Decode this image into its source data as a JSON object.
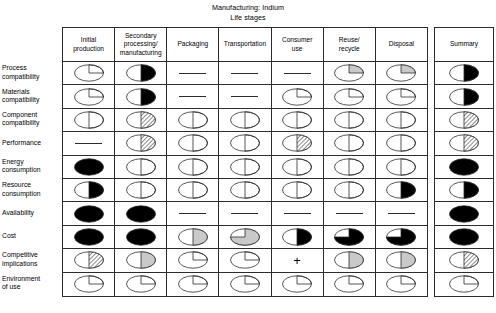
{
  "title": {
    "line1": "Manufacturing: Indium",
    "line2": "Life stages"
  },
  "columns": [
    {
      "id": "initial-production",
      "label": "Initial\nproduction"
    },
    {
      "id": "secondary-processing",
      "label": "Secondary\nprocessing/\nmanufacturing"
    },
    {
      "id": "packaging",
      "label": "Packaging"
    },
    {
      "id": "transportation",
      "label": "Transportation"
    },
    {
      "id": "consumer-use",
      "label": "Consumer\nuse"
    },
    {
      "id": "reuse-recycle",
      "label": "Reuse/\nrecycle"
    },
    {
      "id": "disposal",
      "label": "Disposal"
    }
  ],
  "summary_column": {
    "id": "summary",
    "label": "Summary"
  },
  "rows": [
    {
      "id": "process-compatibility",
      "label": "Process\ncompatibility"
    },
    {
      "id": "materials-compatibility",
      "label": "Materials\ncompatibility"
    },
    {
      "id": "component-compatibility",
      "label": "Component\ncompatibility"
    },
    {
      "id": "performance",
      "label": "Performance"
    },
    {
      "id": "energy-consumption",
      "label": "Energy\nconsumption"
    },
    {
      "id": "resource-consumption",
      "label": "Resource\nconsumption"
    },
    {
      "id": "availability",
      "label": "Availability"
    },
    {
      "id": "cost",
      "label": "Cost"
    },
    {
      "id": "competitive-implications",
      "label": "Competitive\nimplications"
    },
    {
      "id": "environment-of-use",
      "label": "Environment\nof use"
    }
  ],
  "symbol_legend": {
    "dash": "not applicable / no rating",
    "plus": "positive rating marker",
    "quarter-white": "one quarter, unfilled",
    "quarter-gray": "one quarter, gray fill",
    "half-white": "one half, unfilled",
    "half-gray": "one half, gray fill",
    "half-hatch": "one half, hatched fill",
    "half-black": "one half, black fill",
    "threequarter-gray": "three quarters, gray fill",
    "threequarter-black": "three quarters, black fill",
    "full-black": "fully filled black"
  },
  "colors": {
    "ink": "#2c2c2c",
    "black_fill": "#000000",
    "gray_fill": "#c9c9c9",
    "hatch": "#000000",
    "background": "#ffffff"
  },
  "chart_data": {
    "type": "table",
    "title": "Manufacturing: Indium",
    "subtitle": "Life stages",
    "xlabel": "Life stages",
    "ylabel": "Assessment criteria",
    "categories": [
      "Initial production",
      "Secondary processing/manufacturing",
      "Packaging",
      "Transportation",
      "Consumer use",
      "Reuse/recycle",
      "Disposal",
      "Summary"
    ],
    "row_categories": [
      "Process compatibility",
      "Materials compatibility",
      "Component compatibility",
      "Performance",
      "Energy consumption",
      "Resource consumption",
      "Availability",
      "Cost",
      "Competitive implications",
      "Environment of use"
    ],
    "cells": [
      {
        "row": "Process compatibility",
        "values": [
          "quarter-white",
          "half-black",
          "dash",
          "dash",
          "dash",
          "quarter-gray",
          "quarter-gray",
          "half-black"
        ]
      },
      {
        "row": "Materials compatibility",
        "values": [
          "quarter-white",
          "half-black",
          "dash",
          "dash",
          "quarter-white",
          "quarter-white",
          "quarter-white",
          "half-black"
        ]
      },
      {
        "row": "Component compatibility",
        "values": [
          "half-white",
          "half-hatch",
          "half-white",
          "half-white",
          "half-white",
          "half-white",
          "half-white",
          "half-hatch"
        ]
      },
      {
        "row": "Performance",
        "values": [
          "dash",
          "half-hatch",
          "half-white",
          "half-white",
          "half-hatch",
          "half-white",
          "half-white",
          "half-hatch"
        ]
      },
      {
        "row": "Energy consumption",
        "values": [
          "full-black",
          "half-white",
          "half-white",
          "half-white",
          "half-white",
          "half-white",
          "half-white",
          "full-black"
        ]
      },
      {
        "row": "Resource consumption",
        "values": [
          "half-black",
          "half-white",
          "half-white",
          "half-white",
          "half-white",
          "half-white",
          "half-black",
          "half-black"
        ]
      },
      {
        "row": "Availability",
        "values": [
          "full-black",
          "full-black",
          "dash",
          "dash",
          "dash",
          "dash",
          "dash",
          "full-black"
        ]
      },
      {
        "row": "Cost",
        "values": [
          "full-black",
          "full-black",
          "half-gray",
          "threequarter-gray",
          "half-black",
          "threequarter-black",
          "threequarter-black",
          "full-black"
        ]
      },
      {
        "row": "Competitive implications",
        "values": [
          "half-hatch",
          "half-gray",
          "quarter-white",
          "quarter-white",
          "plus",
          "half-gray",
          "half-gray",
          "half-hatch"
        ]
      },
      {
        "row": "Environment of use",
        "values": [
          "quarter-white",
          "quarter-white",
          "quarter-white",
          "quarter-white",
          "quarter-white",
          "quarter-white",
          "quarter-white",
          "quarter-white"
        ]
      }
    ]
  }
}
